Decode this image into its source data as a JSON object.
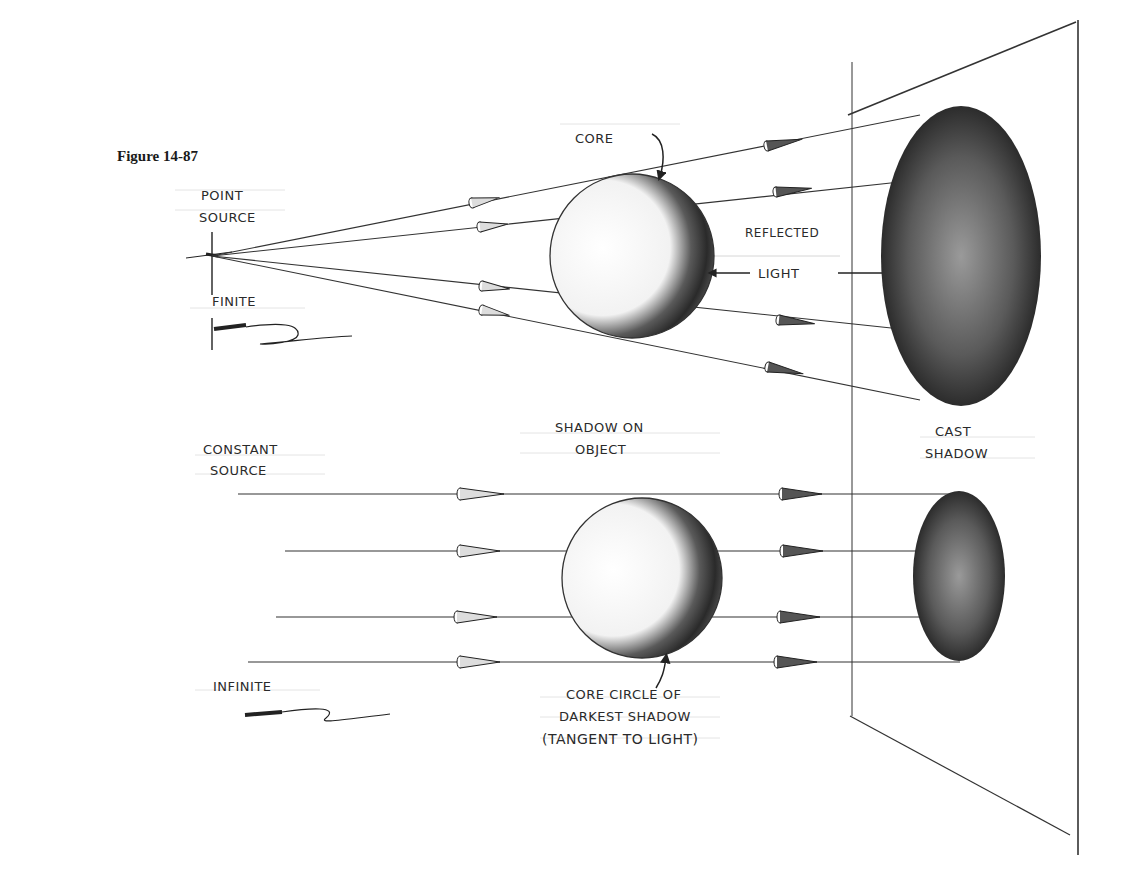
{
  "figure": {
    "caption": "Figure 14-87"
  },
  "top_diagram": {
    "source_label_line1": "POINT",
    "source_label_line2": "SOURCE",
    "distance_label": "FINITE",
    "core_label": "CORE",
    "reflected_label": "REFLECTED",
    "light_label": "LIGHT"
  },
  "bottom_diagram": {
    "source_label_line1": "CONSTANT",
    "source_label_line2": "SOURCE",
    "distance_label": "INFINITE",
    "shadow_on_object_line1": "SHADOW ON",
    "shadow_on_object_line2": "OBJECT",
    "cast_shadow_line1": "CAST",
    "cast_shadow_line2": "SHADOW",
    "core_circle_line1": "CORE CIRCLE OF",
    "core_circle_line2": "DARKEST SHADOW",
    "core_circle_line3": "(TANGENT TO LIGHT)"
  },
  "colors": {
    "ink": "#2a2a2a",
    "paper": "#ffffff",
    "shadow_dark": "#1e1e1e",
    "shadow_mid": "#6a6a6a"
  }
}
